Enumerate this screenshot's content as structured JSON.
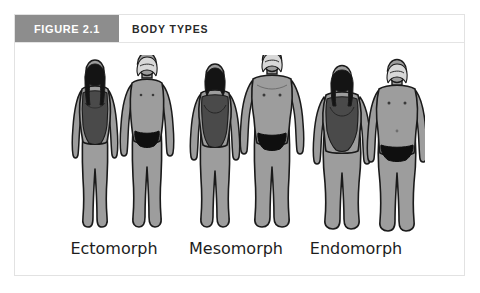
{
  "figure": {
    "label": "FIGURE 2.1",
    "title": "BODY TYPES",
    "label_bg_color": "#8d8d8d",
    "label_text_color": "#ffffff",
    "border_color": "#e2e2e2",
    "background_color": "#ffffff"
  },
  "illustration": {
    "alt_name": "three-body-type-pairs",
    "palette": {
      "skin": "#9d9d9d",
      "skin_shadow": "#8a8a8a",
      "outline": "#1a1a1a",
      "swimsuit_female": "#4a4a4a",
      "briefs_male": "#0f0f0f",
      "hair_dark": "#141414",
      "hair_light": "#d8d8d8"
    },
    "groups": [
      {
        "name": "ectomorph",
        "label": "Ectomorph",
        "figures": [
          {
            "sex": "female",
            "hair": "dark-long",
            "garment": "one-piece-swimsuit"
          },
          {
            "sex": "male",
            "hair": "light-short",
            "garment": "briefs"
          }
        ]
      },
      {
        "name": "mesomorph",
        "label": "Mesomorph",
        "figures": [
          {
            "sex": "female",
            "hair": "dark-short",
            "garment": "one-piece-swimsuit"
          },
          {
            "sex": "male",
            "hair": "light-short",
            "garment": "briefs"
          }
        ]
      },
      {
        "name": "endomorph",
        "label": "Endomorph",
        "figures": [
          {
            "sex": "female",
            "hair": "dark-bob",
            "garment": "one-piece-swimsuit"
          },
          {
            "sex": "male",
            "hair": "light-short",
            "garment": "briefs"
          }
        ]
      }
    ]
  },
  "captions": [
    "Ectomorph",
    "Mesomorph",
    "Endomorph"
  ]
}
